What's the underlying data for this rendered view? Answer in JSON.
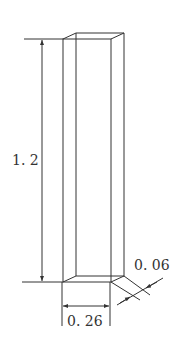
{
  "diagram": {
    "type": "rectangular-prism-dimension-drawing",
    "labels": {
      "height": "1. 2",
      "width": "0. 26",
      "depth": "0. 06"
    },
    "colors": {
      "line": "#333333",
      "background": "#ffffff"
    }
  }
}
